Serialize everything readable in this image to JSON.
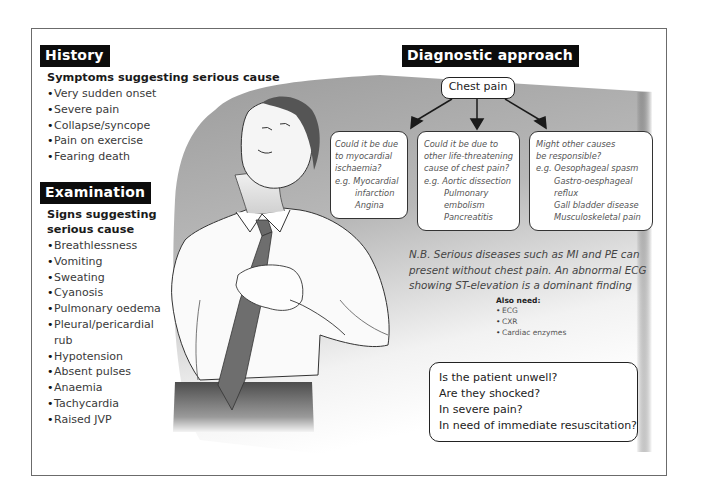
{
  "history": {
    "heading": "History",
    "subheading": "Symptoms suggesting serious cause",
    "items": [
      "Very sudden onset",
      "Severe pain",
      "Collapse/syncope",
      "Pain on exercise",
      "Fearing death"
    ]
  },
  "examination": {
    "heading": "Examination",
    "subheading_line1": "Signs suggesting",
    "subheading_line2": "serious cause",
    "items": [
      "Breathlessness",
      "Vomiting",
      "Sweating",
      "Cyanosis",
      "Pulmonary oedema",
      "Pleural/pericardial",
      "rub",
      "Hypotension",
      "Absent pulses",
      "Anaemia",
      "Tachycardia",
      "Raised JVP"
    ]
  },
  "diagnostic": {
    "heading": "Diagnostic approach",
    "root": "Chest pain",
    "branches": [
      {
        "lines": [
          "Could it be due",
          "to myocardial",
          "ischaemia?",
          "e.g. Myocardial"
        ],
        "indented": [
          "infarction",
          "Angina"
        ]
      },
      {
        "lines": [
          "Could it be due to",
          "other life-threatening",
          "cause of chest pain?",
          "e.g. Aortic dissection"
        ],
        "indented": [
          "Pulmonary",
          "embolism",
          "Pancreatitis"
        ]
      },
      {
        "lines": [
          "Might other causes",
          "be responsible?",
          "e.g. Oesophageal spasm"
        ],
        "indented": [
          "Gastro-oesphageal",
          "reflux",
          "Gall bladder disease",
          "Musculoskeletal pain"
        ]
      }
    ],
    "note_lines": [
      "N.B. Serious diseases such as MI and PE can",
      "present without chest pain. An abnormal ECG",
      "showing ST-elevation is a dominant finding"
    ],
    "also_need": {
      "title": "Also need:",
      "items": [
        "ECG",
        "CXR",
        "Cardiac enzymes"
      ]
    },
    "questions": [
      "Is the patient unwell?",
      "Are they shocked?",
      "In severe pain?",
      "In need of immediate resuscitation?"
    ]
  },
  "illustration": {
    "description": "man-clutching-chest-in-pain",
    "colors": {
      "background_grey": "#9a9a9a",
      "tie": "#6a6a6a",
      "trousers": "#555555",
      "hair": "#4a4a4a"
    }
  }
}
